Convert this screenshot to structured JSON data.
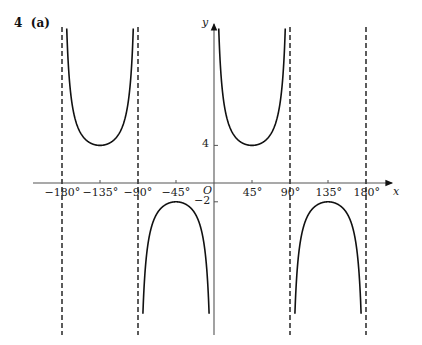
{
  "question": {
    "number": "4",
    "part": "(a)"
  },
  "chart_data": {
    "type": "line",
    "title": "",
    "function_description": "y = 3 cosec(2x) + 1 (reciprocal trig graph with vertical asymptotes)",
    "xlabel": "x",
    "ylabel": "y",
    "origin_label": "O",
    "x_ticks": [
      -180,
      -135,
      -90,
      -45,
      45,
      90,
      135,
      180
    ],
    "x_tick_labels": [
      "−180°",
      "−135°",
      "−90°",
      "−45°",
      "45°",
      "90°",
      "135°",
      "180°"
    ],
    "y_ticks": [
      4,
      -2
    ],
    "y_tick_labels": [
      "4",
      "−2"
    ],
    "asymptotes_x": [
      -180,
      -90,
      90,
      180
    ],
    "asymptote_style": "dashed",
    "turning_points": [
      {
        "x": -135,
        "y": 4,
        "type": "minimum"
      },
      {
        "x": -45,
        "y": -2,
        "type": "maximum"
      },
      {
        "x": 45,
        "y": 4,
        "type": "minimum"
      },
      {
        "x": 135,
        "y": -2,
        "type": "maximum"
      }
    ],
    "xlim": [
      -205,
      205
    ],
    "grid": false,
    "legend": null
  },
  "colors": {
    "curve": "#111111",
    "axis": "#555555",
    "asymptote": "#333333"
  }
}
